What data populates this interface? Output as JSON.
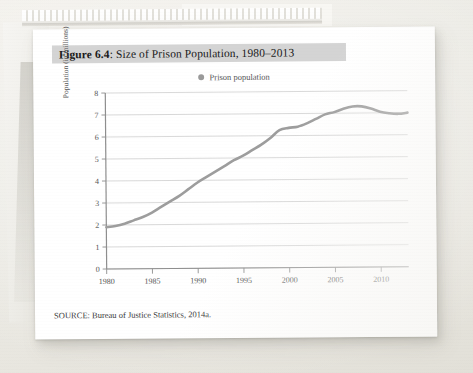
{
  "figure": {
    "label": "Figure 6.4",
    "separator": ":",
    "title": " Size of Prison Population, 1980–2013",
    "source": "SOURCE: Bureau of Justice Statistics, 2014a."
  },
  "legend": {
    "marker_name": "legend-dot-icon",
    "label": "Prison population",
    "marker_color": "#9a9a9a"
  },
  "colors": {
    "line": "#9d9d9d",
    "banner": "#d4d4d4",
    "grid": "#c9c9c9",
    "axis": "#8e8e8e",
    "text": "#555555",
    "card": "#ffffff",
    "backdrop": "#edece7"
  },
  "chart_data": {
    "type": "line",
    "title": "Figure 6.4: Size of Prison Population, 1980–2013",
    "xlabel": "",
    "ylabel": "Population (in millions)",
    "xlim": [
      1980,
      2013
    ],
    "ylim": [
      0,
      8
    ],
    "grid": true,
    "legend_position": "top-center",
    "xticks": [
      1980,
      1985,
      1990,
      1995,
      2000,
      2005,
      2010
    ],
    "yticks": [
      0,
      1,
      2,
      3,
      4,
      5,
      6,
      7,
      8
    ],
    "series": [
      {
        "name": "Prison population",
        "color": "#9d9d9d",
        "x": [
          1980,
          1981,
          1982,
          1983,
          1984,
          1985,
          1986,
          1987,
          1988,
          1989,
          1990,
          1991,
          1992,
          1993,
          1994,
          1995,
          1996,
          1997,
          1998,
          1999,
          2000,
          2001,
          2002,
          2003,
          2004,
          2005,
          2006,
          2007,
          2008,
          2009,
          2010,
          2011,
          2012,
          2013
        ],
        "values": [
          1.9,
          1.95,
          2.05,
          2.2,
          2.35,
          2.55,
          2.8,
          3.05,
          3.3,
          3.6,
          3.9,
          4.15,
          4.4,
          4.65,
          4.9,
          5.1,
          5.35,
          5.6,
          5.9,
          6.25,
          6.35,
          6.4,
          6.55,
          6.75,
          6.95,
          7.05,
          7.2,
          7.3,
          7.3,
          7.2,
          7.05,
          6.98,
          6.95,
          7.0
        ]
      }
    ]
  }
}
